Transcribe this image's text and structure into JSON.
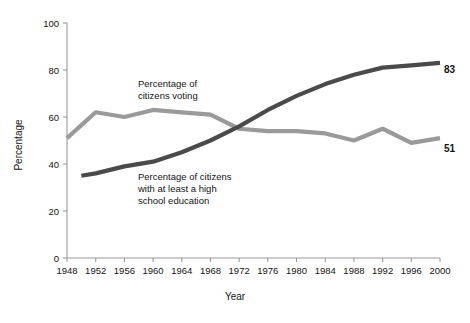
{
  "chart_data": {
    "type": "line",
    "title": "",
    "xlabel": "Year",
    "ylabel": "Percentage",
    "xlim": [
      1948,
      2000
    ],
    "ylim": [
      0,
      100
    ],
    "grid": false,
    "legend_position": "inline-annotations",
    "x_ticks": [
      "1948",
      "1952",
      "1956",
      "1960",
      "1964",
      "1968",
      "1972",
      "1976",
      "1980",
      "1984",
      "1988",
      "1992",
      "1996",
      "2000"
    ],
    "y_ticks": [
      "0",
      "20",
      "40",
      "60",
      "80",
      "100"
    ],
    "series": [
      {
        "name": "Percentage of citizens voting",
        "color": "#9a9a9a",
        "stroke_width": 4.2,
        "annotation": "Percentage of\ncitizens voting",
        "end_label": "51",
        "x": [
          1948,
          1952,
          1956,
          1960,
          1964,
          1968,
          1972,
          1976,
          1980,
          1984,
          1988,
          1992,
          1996,
          2000
        ],
        "values": [
          51,
          62,
          60,
          63,
          62,
          61,
          55,
          54,
          54,
          53,
          50,
          55,
          49,
          51
        ]
      },
      {
        "name": "Percentage of citizens with at least a high school education",
        "color": "#4a4a4a",
        "stroke_width": 4.2,
        "annotation": "Percentage of citizens\nwith at least a high\nschool education",
        "end_label": "83",
        "x": [
          1950,
          1952,
          1956,
          1960,
          1964,
          1968,
          1972,
          1976,
          1980,
          1984,
          1988,
          1992,
          1996,
          2000
        ],
        "values": [
          35,
          36,
          39,
          41,
          45,
          50,
          56,
          63,
          69,
          74,
          78,
          81,
          82,
          83
        ]
      }
    ],
    "annotations": [
      {
        "id": "voting-annotation",
        "lines": [
          "Percentage of",
          "citizens voting"
        ],
        "x": 138,
        "y": 87
      },
      {
        "id": "education-annotation",
        "lines": [
          "Percentage of citizens",
          "with at least a high",
          "school education"
        ],
        "x": 138,
        "y": 180
      }
    ],
    "end_labels": [
      {
        "id": "education-end-label",
        "text": "83",
        "x": 444,
        "y": 73
      },
      {
        "id": "voting-end-label",
        "text": "51",
        "x": 444,
        "y": 152
      }
    ]
  },
  "colors": {
    "voting_line": "#9a9a9a",
    "education_line": "#4a4a4a",
    "axis": "#9a9a9a",
    "text": "#141414",
    "background": "#ffffff"
  }
}
